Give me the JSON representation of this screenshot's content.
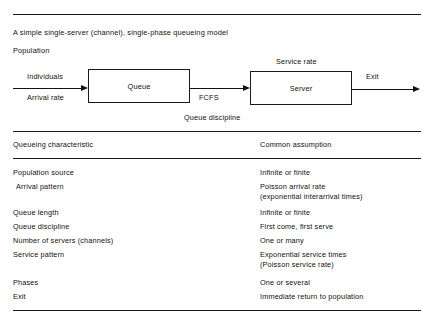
{
  "figure": {
    "title": "A simple single-server (channel), single-phase queueing model",
    "population_label": "Population"
  },
  "diagram": {
    "individuals_label": "Individuals",
    "arrival_rate_label": "Arrival rate",
    "queue_box_label": "Queue",
    "fcfs_label": "FCFS",
    "queue_discipline_label": "Queue discipline",
    "service_rate_label": "Service rate",
    "server_box_label": "Server",
    "exit_label": "Exit"
  },
  "table": {
    "headers": {
      "left": "Queueing characteristic",
      "right": "Common assumption"
    },
    "rows": [
      {
        "characteristic": "Population source",
        "assumption": "Infinite or finite"
      },
      {
        "characteristic": "Arrival pattern",
        "assumption": "Poisson arrival rate\n(exponential interarrival times)"
      },
      {
        "characteristic": "Queue length",
        "assumption": "Infinite or finite"
      },
      {
        "characteristic": "Queue discipline",
        "assumption": "First come, first serve"
      },
      {
        "characteristic": "Number of servers (channels)",
        "assumption": "One or many"
      },
      {
        "characteristic": "Service pattern",
        "assumption": "Exponential service times\n(Poisson service rate)"
      },
      {
        "characteristic": "Phases",
        "assumption": "One or several"
      },
      {
        "characteristic": "Exit",
        "assumption": "Immediate return to population"
      }
    ]
  },
  "colors": {
    "ink": "#111111",
    "rule": "#1a1a1a",
    "background": "#ffffff"
  }
}
